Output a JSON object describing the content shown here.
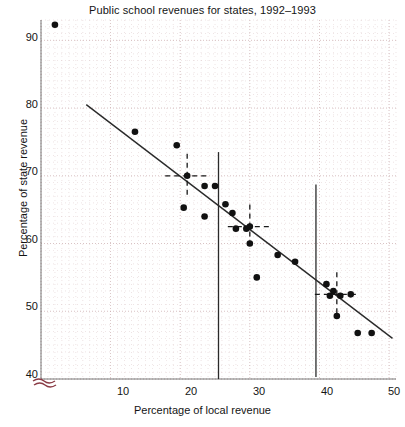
{
  "chart_data": {
    "type": "scatter",
    "title": "Public school revenues for states, 1992–1993",
    "xlabel": "Percentage of local revenue",
    "ylabel": "Percentage of state revenue",
    "xlim": [
      0,
      51
    ],
    "ylim": [
      40,
      93
    ],
    "xticks": [
      10,
      20,
      30,
      40,
      50
    ],
    "yticks": [
      40,
      50,
      60,
      70,
      80,
      90
    ],
    "grid": true,
    "grid_style": "dotted",
    "axis_break": "y-axis broken below 40",
    "legend": null,
    "points": [
      {
        "x": 2.0,
        "y": 92.3,
        "note": "outlier, top left"
      },
      {
        "x": 13.5,
        "y": 76.5
      },
      {
        "x": 19.5,
        "y": 74.5
      },
      {
        "x": 21.0,
        "y": 70.0
      },
      {
        "x": 20.5,
        "y": 65.3
      },
      {
        "x": 23.5,
        "y": 68.5
      },
      {
        "x": 25.0,
        "y": 68.5
      },
      {
        "x": 23.5,
        "y": 64.0
      },
      {
        "x": 26.5,
        "y": 65.8
      },
      {
        "x": 27.5,
        "y": 64.5
      },
      {
        "x": 28.0,
        "y": 62.2
      },
      {
        "x": 29.5,
        "y": 62.2
      },
      {
        "x": 30.0,
        "y": 62.5
      },
      {
        "x": 30.0,
        "y": 60.0
      },
      {
        "x": 34.0,
        "y": 58.3
      },
      {
        "x": 31.0,
        "y": 55.0
      },
      {
        "x": 36.5,
        "y": 57.3
      },
      {
        "x": 41.0,
        "y": 54.0
      },
      {
        "x": 42.0,
        "y": 53.0
      },
      {
        "x": 41.5,
        "y": 52.3
      },
      {
        "x": 43.0,
        "y": 52.3
      },
      {
        "x": 44.5,
        "y": 52.5
      },
      {
        "x": 42.5,
        "y": 49.3
      },
      {
        "x": 45.5,
        "y": 46.8
      },
      {
        "x": 47.5,
        "y": 46.8
      }
    ],
    "regression_line": {
      "description": "least-squares fit line",
      "x_start": 6.5,
      "y_start": 80.5,
      "x_end": 50.5,
      "y_end": 46.0
    },
    "vertical_reference_lines": [
      {
        "x": 25.5,
        "y_top": 73.5,
        "y_bottom": 40.0
      },
      {
        "x": 39.5,
        "y_top": 68.7,
        "y_bottom": 40.3
      }
    ],
    "crosshairs": [
      {
        "x": 21.0,
        "y": 70.0,
        "style": "dashed"
      },
      {
        "x": 30.0,
        "y": 62.5,
        "style": "dashed"
      },
      {
        "x": 42.5,
        "y": 52.5,
        "style": "dashed"
      }
    ],
    "colors": {
      "point": "#111111",
      "line": "#2a2a2a",
      "grid": "#c9a9ab",
      "axis": "#333333",
      "break_mark": "#8a3b45",
      "background": "#ffffff"
    }
  }
}
